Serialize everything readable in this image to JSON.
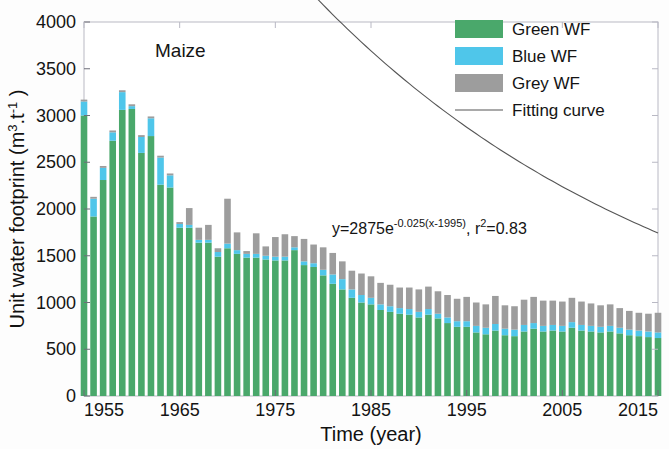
{
  "chart_data": {
    "type": "bar",
    "subtype": "stacked-bar-with-fit-line",
    "title": "Maize",
    "xlabel": "Time (year)",
    "ylabel": "Unit water footprint (m3.t-1)",
    "ylabel_parts": {
      "prefix": "Unit water footprint (m",
      "sup1": "3",
      "mid": ".t",
      "sup2": "-1",
      "suffix": " )"
    },
    "xlim": [
      1955,
      2015
    ],
    "ylim": [
      0,
      4000
    ],
    "xticks": [
      1955,
      1965,
      1975,
      1985,
      1995,
      2005,
      2015
    ],
    "yticks": [
      0,
      500,
      1000,
      1500,
      2000,
      2500,
      3000,
      3500,
      4000
    ],
    "grid": false,
    "legend_position": "top-right",
    "legend": [
      {
        "label": "Green WF",
        "color": "#4aa86b",
        "marker": "swatch"
      },
      {
        "label": "Blue WF",
        "color": "#4fc6ea",
        "marker": "swatch"
      },
      {
        "label": "Grey WF",
        "color": "#9d9d9d",
        "marker": "swatch"
      },
      {
        "label": "Fitting curve",
        "color": "#555555",
        "marker": "line"
      }
    ],
    "annotation": {
      "text": "y=2875e-0.025(x-1995), r2=0.83",
      "parts": {
        "p1": "y=2875e",
        "exp": "-0.025(x-1995)",
        "p2": ", r",
        "sup": "2",
        "p3": "=0.83"
      },
      "equation_coefficient": 2875,
      "equation_rate": -0.025,
      "equation_x_offset": 1995,
      "r_squared": 0.83
    },
    "fit_curve": {
      "name": "Fitting curve",
      "formula": "y = 2875 * exp(-0.025 * (x - 1995))",
      "color": "#555555"
    },
    "categories": [
      1955,
      1956,
      1957,
      1958,
      1959,
      1960,
      1961,
      1962,
      1963,
      1964,
      1965,
      1966,
      1967,
      1968,
      1969,
      1970,
      1971,
      1972,
      1973,
      1974,
      1975,
      1976,
      1977,
      1978,
      1979,
      1980,
      1981,
      1982,
      1983,
      1984,
      1985,
      1986,
      1987,
      1988,
      1989,
      1990,
      1991,
      1992,
      1993,
      1994,
      1995,
      1996,
      1997,
      1998,
      1999,
      2000,
      2001,
      2002,
      2003,
      2004,
      2005,
      2006,
      2007,
      2008,
      2009,
      2010,
      2011,
      2012,
      2013,
      2014,
      2015
    ],
    "series": [
      {
        "name": "Green WF",
        "color": "#4aa86b",
        "values": [
          3000,
          1920,
          2310,
          2730,
          3060,
          3070,
          2600,
          2780,
          2260,
          2230,
          1800,
          1800,
          1640,
          1640,
          1490,
          1580,
          1520,
          1480,
          1480,
          1460,
          1450,
          1450,
          1560,
          1400,
          1380,
          1290,
          1200,
          1140,
          1050,
          1000,
          980,
          920,
          900,
          880,
          870,
          840,
          870,
          830,
          780,
          740,
          740,
          680,
          660,
          700,
          650,
          640,
          690,
          720,
          690,
          700,
          690,
          730,
          700,
          690,
          680,
          690,
          670,
          650,
          640,
          630,
          620
        ],
        "unit": "m3/t"
      },
      {
        "name": "Blue WF",
        "color": "#4fc6ea",
        "values": [
          150,
          190,
          130,
          90,
          190,
          30,
          170,
          190,
          290,
          130,
          40,
          30,
          30,
          30,
          50,
          50,
          40,
          40,
          40,
          40,
          40,
          40,
          30,
          40,
          40,
          60,
          100,
          110,
          90,
          80,
          70,
          60,
          60,
          60,
          60,
          60,
          60,
          50,
          60,
          60,
          60,
          70,
          70,
          70,
          70,
          70,
          70,
          60,
          60,
          60,
          60,
          60,
          60,
          60,
          60,
          60,
          60,
          60,
          60,
          60,
          60
        ],
        "unit": "m3/t"
      },
      {
        "name": "Grey WF",
        "color": "#9d9d9d",
        "values": [
          20,
          20,
          20,
          20,
          20,
          20,
          20,
          20,
          20,
          20,
          20,
          180,
          130,
          160,
          40,
          480,
          190,
          30,
          220,
          100,
          210,
          240,
          120,
          240,
          200,
          240,
          230,
          190,
          200,
          230,
          230,
          230,
          230,
          220,
          230,
          240,
          240,
          240,
          240,
          240,
          260,
          250,
          250,
          300,
          250,
          250,
          270,
          280,
          270,
          260,
          260,
          260,
          250,
          240,
          230,
          230,
          210,
          200,
          190,
          190,
          210
        ],
        "unit": "m3/t"
      }
    ],
    "totals": [
      3170,
      2130,
      2460,
      2840,
      3270,
      3120,
      2790,
      2990,
      2570,
      2380,
      1860,
      2010,
      1800,
      1830,
      1580,
      2110,
      1750,
      1550,
      1740,
      1600,
      1700,
      1730,
      1710,
      1680,
      1620,
      1590,
      1530,
      1440,
      1340,
      1310,
      1280,
      1210,
      1190,
      1160,
      1160,
      1140,
      1170,
      1120,
      1080,
      1040,
      1060,
      1000,
      980,
      1070,
      970,
      960,
      1030,
      1060,
      1020,
      1020,
      1010,
      1050,
      1010,
      990,
      970,
      980,
      940,
      910,
      890,
      880,
      890
    ]
  },
  "plot_note": "Maize"
}
